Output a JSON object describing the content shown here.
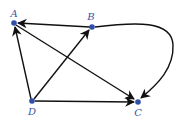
{
  "diagram": {
    "type": "directed-graph",
    "colors": {
      "node": "#2f4fa8",
      "label": "#3a55a8",
      "edge": "#111111"
    },
    "nodes": [
      {
        "id": "A",
        "label": "A",
        "x": 14,
        "y": 23
      },
      {
        "id": "B",
        "label": "B",
        "x": 92,
        "y": 27
      },
      {
        "id": "C",
        "label": "C",
        "x": 138,
        "y": 102
      },
      {
        "id": "D",
        "label": "D",
        "x": 32,
        "y": 101
      }
    ],
    "edges": [
      {
        "from": "B",
        "to": "A"
      },
      {
        "from": "A",
        "to": "C"
      },
      {
        "from": "D",
        "to": "A"
      },
      {
        "from": "D",
        "to": "B"
      },
      {
        "from": "D",
        "to": "C"
      },
      {
        "from": "B",
        "to": "C",
        "curved": true
      }
    ]
  }
}
